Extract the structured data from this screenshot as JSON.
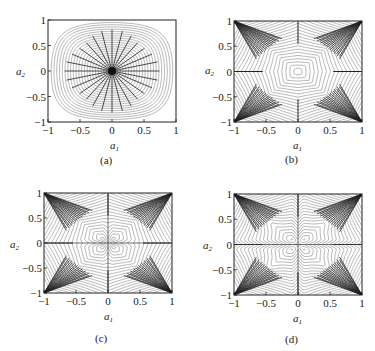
{
  "chart_data": [
    {
      "id": "a",
      "type": "contour",
      "caption": "(a)",
      "xlabel": "a",
      "xlabel_sub": "1",
      "ylabel": "a",
      "ylabel_sub": "2",
      "xlim": [
        -1,
        1
      ],
      "ylim": [
        -1,
        1
      ],
      "xticks": [
        "-1",
        "-0.5",
        "0",
        "0.5",
        "1"
      ],
      "yticks": [
        "1",
        "0.5",
        "0",
        "-0.5",
        "-1"
      ],
      "xtick_values": [
        -1,
        -0.5,
        0,
        0.5,
        1
      ],
      "ytick_values": [
        1,
        0.5,
        0,
        -0.5,
        -1
      ],
      "description": "Rounded-square concentric level curves centered at origin with radial gradient lines converging at (0,0)",
      "field": "rounded_square",
      "gradient_sinks": [
        [
          0,
          0
        ]
      ]
    },
    {
      "id": "b",
      "type": "contour",
      "caption": "(b)",
      "xlabel": "a",
      "xlabel_sub": "1",
      "ylabel": "a",
      "ylabel_sub": "2",
      "xlim": [
        -1,
        1
      ],
      "ylim": [
        -1,
        1
      ],
      "xticks": [
        "-1",
        "-0.5",
        "0",
        "0.5",
        "1"
      ],
      "yticks": [
        "1",
        "0.5",
        "0",
        "-0.5",
        "-1"
      ],
      "xtick_values": [
        -1,
        -0.5,
        0,
        0.5,
        1
      ],
      "ytick_values": [
        1,
        0.5,
        0,
        -0.5,
        -1
      ],
      "description": "Level curves parallel to borders with gradient lines fanning into the four corners",
      "field": "corners",
      "gradient_sinks": [
        [
          -1,
          1
        ],
        [
          1,
          1
        ],
        [
          -1,
          -1
        ],
        [
          1,
          -1
        ]
      ]
    },
    {
      "id": "c",
      "type": "contour",
      "caption": "(c)",
      "xlabel": "a",
      "xlabel_sub": "1",
      "ylabel": "a",
      "ylabel_sub": "2",
      "xlim": [
        -1,
        1
      ],
      "ylim": [
        -1,
        1
      ],
      "xticks": [
        "-1",
        "-0.5",
        "0",
        "0.5",
        "1"
      ],
      "yticks": [
        "1",
        "0.5",
        "0",
        "-0.5",
        "-1"
      ],
      "xtick_values": [
        -1,
        -0.5,
        0,
        0.5,
        1
      ],
      "ytick_values": [
        1,
        0.5,
        0,
        -0.5,
        -1
      ],
      "description": "Corner-fanning gradient lines with a cross-shaped contour around the origin",
      "field": "corners_cross",
      "gradient_sinks": [
        [
          -1,
          1
        ],
        [
          1,
          1
        ],
        [
          -1,
          -1
        ],
        [
          1,
          -1
        ]
      ]
    },
    {
      "id": "d",
      "type": "contour",
      "caption": "(d)",
      "xlabel": "a",
      "xlabel_sub": "1",
      "ylabel": "a",
      "ylabel_sub": "2",
      "xlim": [
        -1,
        1
      ],
      "ylim": [
        -1,
        1
      ],
      "xticks": [
        "-1",
        "-0.5",
        "0",
        "0.5",
        "1"
      ],
      "yticks": [
        "1",
        "0.5",
        "0",
        "-0.5",
        "-1"
      ],
      "xtick_values": [
        -1,
        -0.5,
        0,
        0.5,
        1
      ],
      "ytick_values": [
        1,
        0.5,
        0,
        -0.5,
        -1
      ],
      "description": "Corner-fanning gradient lines with closed loops in each quadrant and dense bands along both axes",
      "field": "corners_quadrant_loops",
      "gradient_sinks": [
        [
          -1,
          1
        ],
        [
          1,
          1
        ],
        [
          -1,
          -1
        ],
        [
          1,
          -1
        ]
      ]
    }
  ]
}
